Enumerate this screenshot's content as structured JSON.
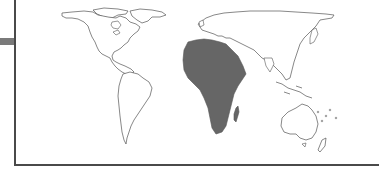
{
  "map": {
    "type": "world-outline-map",
    "highlighted_region": "Africa",
    "highlight_color": "#666666",
    "outline_color": "#555555",
    "background_color": "#ffffff",
    "regions": [
      {
        "name": "North America",
        "highlighted": false
      },
      {
        "name": "South America",
        "highlighted": false
      },
      {
        "name": "Europe",
        "highlighted": false
      },
      {
        "name": "Asia",
        "highlighted": false
      },
      {
        "name": "Africa",
        "highlighted": true
      },
      {
        "name": "Madagascar",
        "highlighted": true
      },
      {
        "name": "Australia",
        "highlighted": false
      },
      {
        "name": "New Zealand",
        "highlighted": false
      },
      {
        "name": "Greenland",
        "highlighted": false
      }
    ]
  },
  "frame": {
    "side_tab_color": "#7a7a7a",
    "border_color": "#4a4a4a"
  }
}
